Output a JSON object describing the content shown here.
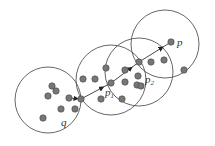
{
  "diagram": {
    "labels": {
      "q": "q",
      "p1": "p",
      "p1_sub": "1",
      "p2": "p",
      "p2_sub": "2",
      "p": "p"
    },
    "colors": {
      "stroke": "#555555",
      "point_fill": "#777777",
      "background": "#ffffff"
    },
    "circles": [
      {
        "name": "circle-q",
        "cx": 48,
        "cy": 100,
        "r": 33
      },
      {
        "name": "circle-p1",
        "cx": 111,
        "cy": 80,
        "r": 35
      },
      {
        "name": "circle-p2",
        "cx": 139,
        "cy": 72,
        "r": 34
      },
      {
        "name": "circle-p",
        "cx": 165,
        "cy": 44,
        "r": 34
      }
    ],
    "points": [
      [
        52,
        86
      ],
      [
        56,
        91
      ],
      [
        48,
        96
      ],
      [
        69,
        98
      ],
      [
        61,
        109
      ],
      [
        75,
        109
      ],
      [
        43,
        118
      ],
      [
        81,
        99
      ],
      [
        83,
        79
      ],
      [
        95,
        79
      ],
      [
        106,
        68
      ],
      [
        111,
        83
      ],
      [
        101,
        99
      ],
      [
        122,
        99
      ],
      [
        125,
        70
      ],
      [
        125,
        82
      ],
      [
        139,
        62
      ],
      [
        138,
        76
      ],
      [
        137,
        85
      ],
      [
        141,
        86
      ],
      [
        171,
        42
      ],
      [
        151,
        62
      ],
      [
        164,
        60
      ],
      [
        184,
        70
      ]
    ],
    "path": [
      [
        69,
        98
      ],
      [
        81,
        99
      ],
      [
        111,
        83
      ],
      [
        139,
        62
      ],
      [
        171,
        42
      ]
    ]
  }
}
